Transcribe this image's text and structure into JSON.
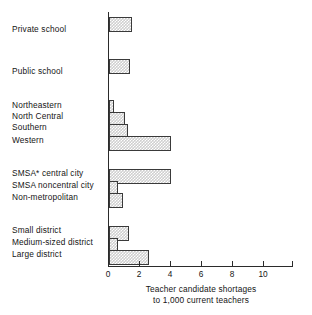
{
  "chart_data": {
    "type": "bar",
    "orientation": "horizontal",
    "title": "",
    "xlabel": "Teacher candidate shortages to 1,000 current teachers",
    "ylabel": "",
    "xlim": [
      0,
      11.8
    ],
    "grid": false,
    "legend": null,
    "xticks": [
      0,
      2,
      4,
      6,
      8,
      10
    ],
    "xtick_labels": [
      "0",
      "2",
      "4",
      "6",
      "8",
      "10"
    ],
    "categories": [
      "Private school",
      "Public school",
      "Northeastern",
      "North Central",
      "Southern",
      "Western",
      "SMSA* central city",
      "SMSA noncentral city",
      "Non-metropolitan",
      "Small district",
      "Medium-sized district",
      "Large district"
    ],
    "values": [
      1.5,
      1.35,
      0.3,
      1.0,
      1.25,
      4.0,
      4.0,
      0.6,
      0.9,
      1.3,
      0.6,
      2.6
    ],
    "groups": [
      {
        "name": "school-type",
        "categories": [
          "Private school",
          "Public school"
        ]
      },
      {
        "name": "region",
        "categories": [
          "Northeastern",
          "North Central",
          "Southern",
          "Western"
        ]
      },
      {
        "name": "metropolitan-status",
        "categories": [
          "SMSA* central city",
          "SMSA noncentral city",
          "Non-metropolitan"
        ]
      },
      {
        "name": "district-size",
        "categories": [
          "Small district",
          "Medium-sized district",
          "Large district"
        ]
      }
    ]
  },
  "axis_title": {
    "line1": "Teacher candidate shortages",
    "line2": "to 1,000 current teachers"
  },
  "labels": {
    "c0": "Private school",
    "c1": "Public school",
    "c2": "Northeastern",
    "c3": "North Central",
    "c4": "Southern",
    "c5": "Western",
    "c6": "SMSA* central city",
    "c7": "SMSA noncentral city",
    "c8": "Non-metropolitan",
    "c9": "Small district",
    "c10": "Medium-sized district",
    "c11": "Large district"
  },
  "ticks": {
    "t0": "0",
    "t1": "2",
    "t2": "4",
    "t3": "6",
    "t4": "8",
    "t5": "10"
  },
  "colors": {
    "bar_fill": "#cfcfcf",
    "bar_edge": "#3a3a3a",
    "axis": "#2b2b2b",
    "text": "#151515",
    "background": "#ffffff"
  }
}
